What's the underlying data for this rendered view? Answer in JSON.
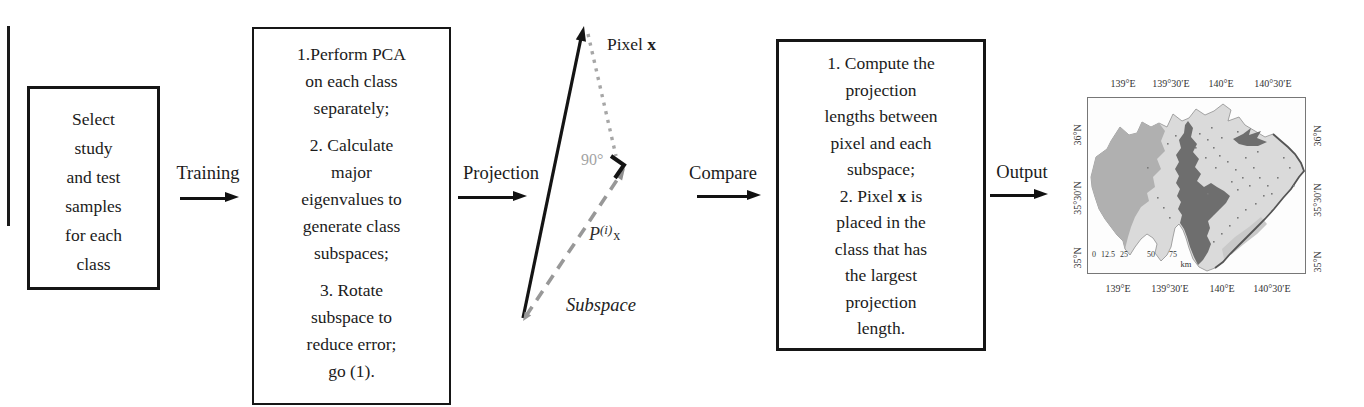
{
  "flow": {
    "box1": {
      "lines": [
        "Select",
        "study",
        "and test",
        "samples",
        "for each",
        "class"
      ]
    },
    "training_label": "Training",
    "box2": {
      "item1": [
        "1.Perform PCA",
        "on each class",
        "separately;"
      ],
      "item2": [
        "2. Calculate",
        "major",
        "eigenvalues to",
        "generate class",
        "subspaces;"
      ],
      "item3": [
        "3. Rotate",
        "subspace to",
        "reduce error;",
        "go (1)."
      ]
    },
    "projection_label": "Projection",
    "compare_label": "Compare",
    "box4": {
      "item1": [
        "1. Compute the",
        "projection",
        "lengths between",
        "pixel and each",
        "subspace;"
      ],
      "item2_prefix": "2. Pixel ",
      "item2_bold": "x",
      "item2_suffix": " is",
      "item2_rest": [
        "placed in the",
        "class that has",
        "the largest",
        "projection",
        "length."
      ]
    },
    "output_label": "Output"
  },
  "vector_diagram": {
    "pixel_label_prefix": "Pixel ",
    "pixel_label_bold": "x",
    "angle_label": "90°",
    "p_base": "P",
    "p_sup": "(i)",
    "p_sub": "x",
    "subspace_label": "Subspace"
  },
  "map": {
    "top_labels": [
      "139°E",
      "139°30′E",
      "140°E",
      "140°30′E"
    ],
    "bottom_labels": [
      "139°E",
      "139°30′E",
      "140°E",
      "140°30′E"
    ],
    "left_labels": [
      "36°N",
      "35°30′N",
      "35°N"
    ],
    "right_labels": [
      "36°N",
      "35°30′N",
      "35°N"
    ],
    "scale_ticks": [
      "0",
      "12.5",
      "25",
      "50",
      "75"
    ],
    "scale_unit": "km",
    "colors": {
      "lowland": "#dadada",
      "mountain": "#b0b0b0",
      "hills": "#c9c9c9",
      "urban": "#6e6e6e",
      "coast": "#555555"
    }
  }
}
